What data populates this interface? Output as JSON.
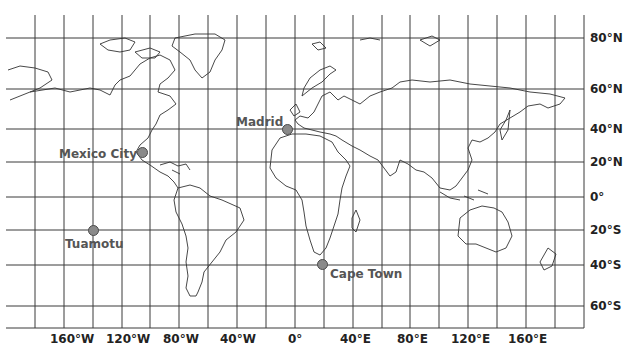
{
  "map": {
    "projection": "equirectangular-like world grid",
    "latitude_labels": [
      "80°N",
      "60°N",
      "40°N",
      "20°N",
      "0°",
      "20°S",
      "40°S",
      "60°S"
    ],
    "longitude_labels": [
      "160°W",
      "120°W",
      "80°W",
      "40°W",
      "0°",
      "40°E",
      "80°E",
      "120°E",
      "160°E"
    ],
    "cities": [
      {
        "name": "Madrid"
      },
      {
        "name": "Mexico City"
      },
      {
        "name": "Tuamotu"
      },
      {
        "name": "Cape Town"
      }
    ],
    "colors": {
      "grid": "#3a3a3a",
      "coast": "#333333",
      "marker": "#8a8a8a",
      "marker_border": "#4a4a4a",
      "label": "#555555"
    }
  }
}
